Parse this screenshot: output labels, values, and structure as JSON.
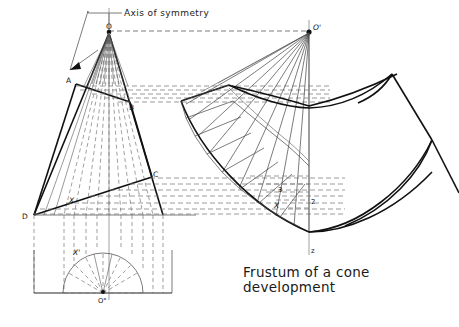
{
  "drawing": {
    "title_line1": "Frustum of a cone",
    "title_line2": "development",
    "axis_label": "Axis of symmetry",
    "labels": {
      "apex_front": "O",
      "apex_dev": "O'",
      "circle_center": "O\"",
      "point_a": "A",
      "point_b": "B",
      "point_c": "C",
      "point_d": "D",
      "gen_x_front": "X",
      "gen_x_plan": "X'",
      "gen_x_dev": "X",
      "station_3": "3",
      "station_2": "2",
      "vertical_z": "z"
    },
    "colors": {
      "ink": "#1a1a1a",
      "hidden": "#666666",
      "paper": "#ffffff",
      "center_line": "#888888"
    },
    "geometry": {
      "apex_front": [
        109,
        31
      ],
      "apex_dev": [
        309,
        31
      ],
      "plan_center": [
        103,
        293
      ],
      "plan_radius": 40,
      "frustum_a": [
        76,
        84
      ],
      "frustum_b": [
        130,
        102
      ],
      "frustum_c": [
        152,
        177
      ],
      "frustum_d": [
        34,
        215
      ],
      "axis_x": 109,
      "dev_axis_x": 309,
      "generator_count": 9
    },
    "projection_rows_upper": [
      86,
      90,
      94,
      98,
      102
    ],
    "projection_rows_lower": [
      178,
      186,
      194,
      202,
      210
    ],
    "view_names": {
      "front": "front-elevation-view",
      "plan": "plan-semicircle-view",
      "development": "pattern-development-view"
    }
  }
}
